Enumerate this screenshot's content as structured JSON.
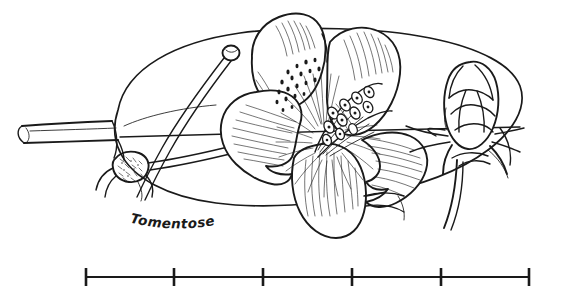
{
  "illustration": {
    "kind": "botanical-line-drawing",
    "medium": "pen-and-ink",
    "background_color": "#ffffff",
    "ink_color": "#1a1a1a",
    "subject": "flower with leaf, curved style and scaly bud",
    "annotations": [
      {
        "id": "tomentose-label",
        "text": "Tomentose",
        "style": "handwritten-italic",
        "points_to": "hairy node at base of pedicel"
      }
    ],
    "parts": [
      {
        "name": "leaf-blade",
        "label": "elliptical leaf behind flower"
      },
      {
        "name": "petiole",
        "label": "leaf stalk at left"
      },
      {
        "name": "tomentose-node",
        "label": "hairy swollen node"
      },
      {
        "name": "style",
        "label": "long curved style with capitate stigma"
      },
      {
        "name": "corolla",
        "label": "five-lobed flower with spotted throat"
      },
      {
        "name": "stamens",
        "label": "cluster of anthers in throat"
      },
      {
        "name": "flower-bud",
        "label": "scaly bud at right"
      }
    ]
  },
  "scale_bar": {
    "label": "",
    "tick_count": 6,
    "segment_count": 5,
    "start_x": 85,
    "end_x": 530,
    "baseline_y": 277,
    "tick_positions": [
      85,
      174,
      263,
      352,
      441,
      530
    ],
    "tick_half_height": 9
  }
}
